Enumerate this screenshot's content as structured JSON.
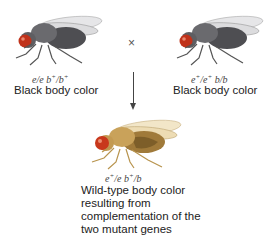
{
  "diagram": {
    "type": "genetic-cross-complementation",
    "cross_symbol": "×",
    "parents": [
      {
        "position": "left",
        "genotype": {
          "g1": "e",
          "sep1": "/",
          "g2": "e",
          "g3": "b",
          "sup3": "+",
          "sep2": "/",
          "g4": "b",
          "sup4": "+"
        },
        "phenotype": "Black body color",
        "body_color": "#5a5a5e",
        "eye_color": "#c0321a"
      },
      {
        "position": "right",
        "genotype": {
          "g1": "e",
          "sup1": "+",
          "sep1": "/",
          "g2": "e",
          "sup2": "+",
          "g3": "b",
          "sep2": "/",
          "g4": "b"
        },
        "phenotype": "Black body color",
        "body_color": "#5a5a5e",
        "eye_color": "#c0321a"
      }
    ],
    "offspring": {
      "genotype": {
        "g1": "e",
        "sup1": "+",
        "sep1": "/",
        "g2": "e",
        "g3": "b",
        "sup3": "+",
        "sep2": "/",
        "g4": "b"
      },
      "phenotype_lines": [
        "Wild-type body color",
        "resulting from",
        "complementation of the",
        "two mutant genes"
      ],
      "body_color": "#c9a25a",
      "eye_color": "#c8381c"
    }
  }
}
